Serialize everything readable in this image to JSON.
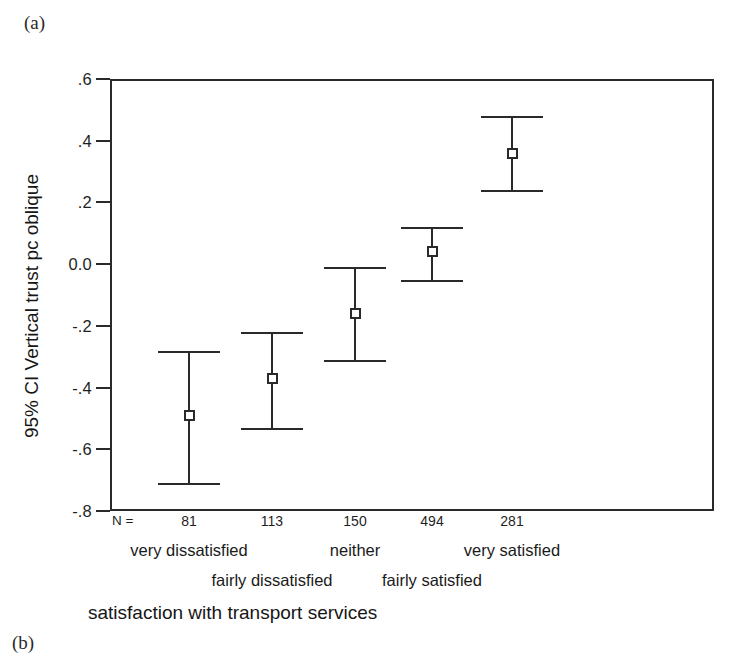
{
  "figure": {
    "panel_label_a": "(a)",
    "panel_label_b": "(b)"
  },
  "chart_data": {
    "type": "scatter",
    "title": "",
    "subtitle": "",
    "xlabel": "satisfaction with transport services",
    "ylabel": "95% CI Vertical trust pc oblique",
    "categories": [
      "very dissatisfied",
      "fairly dissatisfied",
      "neither",
      "fairly satisfied",
      "very satisfied"
    ],
    "n_label": "N =",
    "n_values": [
      81,
      113,
      150,
      494,
      281
    ],
    "means": [
      -0.49,
      -0.37,
      -0.16,
      0.04,
      0.36
    ],
    "ci_lower": [
      -0.71,
      -0.53,
      -0.31,
      -0.05,
      0.24
    ],
    "ci_upper": [
      -0.28,
      -0.22,
      -0.01,
      0.12,
      0.48
    ],
    "ylim": [
      -0.8,
      0.6
    ],
    "ytick_values": [
      0.6,
      0.4,
      0.2,
      0.0,
      -0.2,
      -0.4,
      -0.6,
      -0.8
    ],
    "ytick_labels": [
      ".6",
      ".4",
      ".2",
      "0.0",
      "-.2",
      "-.4",
      "-.6",
      "-.8"
    ],
    "grid": false,
    "legend": "none",
    "marker": "open-square",
    "error_bar": "95% confidence interval",
    "line_color": "#2a2a2a",
    "background_color": "#ffffff"
  }
}
